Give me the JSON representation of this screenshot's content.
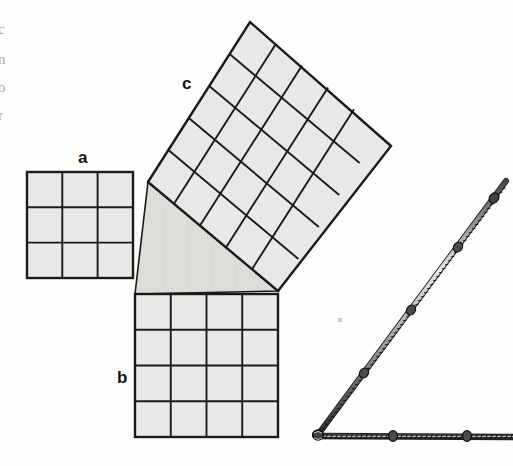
{
  "figure": {
    "background_color": "#fdfdfc",
    "square_fill": "#e9e9e7",
    "triangle_fill": "#dededa",
    "line_color": "#1a1a1a",
    "rope_color": "#2b2b2b"
  },
  "labels": {
    "a": "a",
    "b": "b",
    "c": "c"
  },
  "margin_fragments": [
    "c",
    "n",
    "o",
    "r"
  ],
  "squares": {
    "a": {
      "label": "a",
      "grid": 3,
      "cells": 9,
      "side_units": 3,
      "x": 27,
      "y": 172,
      "size": 106,
      "rotation_deg": 0,
      "label_x": 78,
      "label_y": 149
    },
    "b": {
      "label": "b",
      "grid": 4,
      "cells": 16,
      "side_units": 4,
      "x": 135,
      "y": 294,
      "size": 143,
      "rotation_deg": 0,
      "label_x": 117,
      "label_y": 369
    },
    "c": {
      "label": "c",
      "grid": 5,
      "cells": 25,
      "side_units": 5,
      "corner_top_x": 250,
      "corner_top_y": 22,
      "corner_right_x": 391,
      "corner_right_y": 146,
      "corner_bottom_x": 278,
      "corner_bottom_y": 291,
      "corner_left_x": 148,
      "corner_left_y": 182,
      "label_x": 182,
      "label_y": 75
    }
  },
  "triangle": {
    "vertex_right_angle_x": 135,
    "vertex_right_angle_y": 294,
    "vertex_a_x": 148,
    "vertex_a_y": 182,
    "vertex_b_x": 278,
    "vertex_b_y": 291,
    "ratio": "3-4-5"
  },
  "rope": {
    "name": "knotted-rope-triangle",
    "apex_x": 504,
    "apex_y": 184,
    "corner_x": 317,
    "corner_y": 436,
    "end_x": 513,
    "end_y": 436,
    "hypotenuse_knots": 4,
    "base_knots": 3,
    "thickness": 5
  },
  "speck": {
    "x": 340,
    "y": 320,
    "size": 4
  }
}
